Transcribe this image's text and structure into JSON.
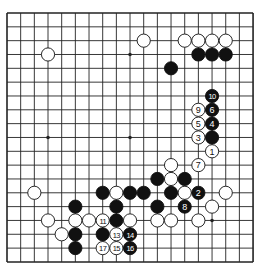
{
  "board": {
    "size": 19,
    "origin_x": 7,
    "origin_y": 13,
    "step_x": 13.67,
    "step_y": 13.83,
    "stone_radius": 6.6,
    "line_color": "#222222",
    "background": "#ffffff",
    "black_color": "#111111",
    "white_color": "#ffffff",
    "star_points": [
      [
        3,
        3
      ],
      [
        9,
        3
      ],
      [
        15,
        3
      ],
      [
        3,
        9
      ],
      [
        9,
        9
      ],
      [
        15,
        9
      ],
      [
        3,
        15
      ],
      [
        9,
        15
      ],
      [
        15,
        15
      ]
    ]
  },
  "stones": {
    "white": [
      [
        3,
        3
      ],
      [
        10,
        2
      ],
      [
        13,
        2
      ],
      [
        14,
        2
      ],
      [
        15,
        2
      ],
      [
        16,
        2
      ],
      [
        12,
        11
      ],
      [
        12,
        12
      ],
      [
        2,
        13
      ],
      [
        8,
        13
      ],
      [
        13,
        13
      ],
      [
        16,
        13
      ],
      [
        15,
        14
      ],
      [
        3,
        15
      ],
      [
        5,
        15
      ],
      [
        6,
        15
      ],
      [
        9,
        15
      ],
      [
        11,
        15
      ],
      [
        12,
        15
      ],
      [
        14,
        15
      ],
      [
        4,
        16
      ]
    ],
    "black": [
      [
        14,
        3
      ],
      [
        15,
        3
      ],
      [
        16,
        3
      ],
      [
        12,
        4
      ],
      [
        15,
        9
      ],
      [
        11,
        12
      ],
      [
        13,
        12
      ],
      [
        7,
        13
      ],
      [
        9,
        13
      ],
      [
        10,
        13
      ],
      [
        12,
        13
      ],
      [
        5,
        14
      ],
      [
        8,
        14
      ],
      [
        11,
        14
      ],
      [
        8,
        15
      ],
      [
        5,
        16
      ],
      [
        7,
        16
      ],
      [
        5,
        17
      ]
    ]
  },
  "moves": [
    {
      "n": "1",
      "color": "white",
      "x": 15,
      "y": 10
    },
    {
      "n": "2",
      "color": "black",
      "x": 14,
      "y": 13
    },
    {
      "n": "3",
      "color": "white",
      "x": 14,
      "y": 9
    },
    {
      "n": "4",
      "color": "black",
      "x": 15,
      "y": 8
    },
    {
      "n": "5",
      "color": "white",
      "x": 14,
      "y": 8
    },
    {
      "n": "6",
      "color": "black",
      "x": 15,
      "y": 7
    },
    {
      "n": "7",
      "color": "white",
      "x": 14,
      "y": 11
    },
    {
      "n": "8",
      "color": "black",
      "x": 13,
      "y": 14
    },
    {
      "n": "9",
      "color": "white",
      "x": 14,
      "y": 7
    },
    {
      "n": "10",
      "color": "black",
      "x": 15,
      "y": 6
    },
    {
      "n": "11",
      "color": "white",
      "x": 7,
      "y": 15
    },
    {
      "n": "13",
      "color": "white",
      "x": 8,
      "y": 16
    },
    {
      "n": "14",
      "color": "black",
      "x": 9,
      "y": 16
    },
    {
      "n": "15",
      "color": "white",
      "x": 8,
      "y": 17
    },
    {
      "n": "16",
      "color": "black",
      "x": 9,
      "y": 17
    },
    {
      "n": "17",
      "color": "white",
      "x": 7,
      "y": 17
    }
  ]
}
